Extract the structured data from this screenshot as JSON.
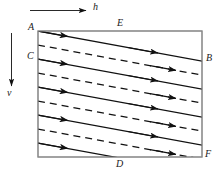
{
  "figure": {
    "title": "",
    "background_color": "#ffffff",
    "ink_color": "#1a1a1a",
    "frame_color": "#8a8a8a",
    "axes": {
      "horizontal_arrow": {
        "name": "h",
        "label": "h",
        "direction": "right",
        "x1": 30,
        "y1": 10,
        "x2": 88,
        "y2": 10,
        "label_x": 94,
        "label_y": 5
      },
      "vertical_arrow": {
        "name": "v",
        "label": "v",
        "direction": "down",
        "x1": 11,
        "y1": 33,
        "x2": 11,
        "y2": 88,
        "label_x": 7,
        "label_y": 92
      }
    },
    "rectangle": {
      "left": 38,
      "top": 31,
      "right": 202,
      "bottom": 157,
      "stroke": "#8a8a8a",
      "stroke_width": 1
    },
    "vertex_labels": [
      {
        "id": "A",
        "text": "A",
        "x": 29,
        "y": 23,
        "position": "top-left-outside"
      },
      {
        "id": "C",
        "text": "C",
        "x": 28,
        "y": 52,
        "position": "left-outside"
      },
      {
        "id": "E",
        "text": "E",
        "x": 118,
        "y": 20,
        "position": "top-outside"
      },
      {
        "id": "B",
        "text": "B",
        "x": 206,
        "y": 54,
        "position": "right-outside"
      },
      {
        "id": "D",
        "text": "D",
        "x": 117,
        "y": 161,
        "position": "bottom-outside"
      },
      {
        "id": "F",
        "text": "F",
        "x": 205,
        "y": 151,
        "position": "bottom-right-outside"
      }
    ],
    "flow_lines": {
      "count": 9,
      "description": "alternating solid and dashed sheared streamlines sloping downward to the right",
      "slope_dx": 164,
      "slope_dy": 30,
      "dash_pattern": "7 5",
      "styles": [
        "solid",
        "dashed",
        "solid",
        "dashed",
        "solid",
        "dashed",
        "solid",
        "dashed",
        "solid"
      ],
      "left_y": [
        31,
        45,
        59,
        73,
        87,
        101,
        115,
        129,
        143
      ],
      "arrow_positions": [
        0.38,
        0.82
      ]
    }
  }
}
